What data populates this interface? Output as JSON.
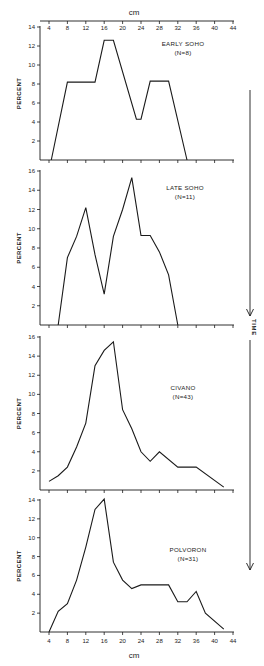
{
  "figure": {
    "x_unit_label": "cm",
    "y_axis_label": "PERCENT",
    "time_arrow_label": "TIME",
    "x_ticks": [
      4,
      8,
      12,
      16,
      20,
      24,
      28,
      32,
      36,
      40,
      44
    ]
  },
  "chart_data": [
    {
      "type": "line",
      "title": "EARLY SOHO",
      "subtitle": "(N=8)",
      "xlabel": "cm",
      "ylabel": "PERCENT",
      "xlim": [
        4,
        44
      ],
      "ylim": [
        0,
        14
      ],
      "y_ticks": [
        2,
        4,
        6,
        8,
        10,
        12,
        14
      ],
      "x": [
        4.5,
        8,
        14,
        16,
        18,
        23,
        24,
        26,
        30,
        34
      ],
      "values": [
        0,
        8.2,
        8.2,
        12.6,
        12.6,
        4.3,
        4.3,
        8.3,
        8.3,
        0
      ],
      "grid": false,
      "legend": "none"
    },
    {
      "type": "line",
      "title": "LATE SOHO",
      "subtitle": "(N=11)",
      "xlabel": "cm",
      "ylabel": "PERCENT",
      "xlim": [
        4,
        44
      ],
      "ylim": [
        0,
        16
      ],
      "y_ticks": [
        2,
        4,
        6,
        8,
        10,
        12,
        14,
        16
      ],
      "x": [
        6,
        8,
        10,
        12,
        14,
        16,
        18,
        20,
        22,
        24,
        26,
        28,
        30,
        32
      ],
      "values": [
        0,
        7.0,
        9.2,
        12.2,
        7.3,
        3.2,
        9.2,
        12.0,
        15.3,
        9.3,
        9.3,
        7.6,
        5.2,
        0
      ],
      "grid": false,
      "legend": "none"
    },
    {
      "type": "line",
      "title": "CIVANO",
      "subtitle": "(N=43)",
      "xlabel": "cm",
      "ylabel": "PERCENT",
      "xlim": [
        4,
        44
      ],
      "ylim": [
        0,
        16
      ],
      "y_ticks": [
        2,
        4,
        6,
        8,
        10,
        12,
        14,
        16
      ],
      "x": [
        4,
        6,
        8,
        10,
        12,
        14,
        16,
        18,
        20,
        22,
        24,
        26,
        28,
        32,
        36,
        42
      ],
      "values": [
        0.9,
        1.5,
        2.4,
        4.5,
        7.0,
        13.0,
        14.6,
        15.5,
        8.4,
        6.4,
        4.0,
        3.0,
        4.0,
        2.4,
        2.4,
        0.3
      ],
      "grid": false,
      "legend": "none"
    },
    {
      "type": "line",
      "title": "POLVORON",
      "subtitle": "(N=31)",
      "xlabel": "cm",
      "ylabel": "PERCENT",
      "xlim": [
        4,
        44
      ],
      "ylim": [
        0,
        14
      ],
      "y_ticks": [
        2,
        4,
        6,
        8,
        10,
        12,
        14
      ],
      "x": [
        4,
        6,
        8,
        10,
        12,
        14,
        16,
        18,
        20,
        22,
        24,
        30,
        32,
        34,
        36,
        38,
        42
      ],
      "values": [
        0,
        2.2,
        3.0,
        5.5,
        9.0,
        13.0,
        14.1,
        7.4,
        5.5,
        4.6,
        5.0,
        5.0,
        3.2,
        3.2,
        4.3,
        2.0,
        0.3
      ],
      "grid": false,
      "legend": "none"
    }
  ]
}
